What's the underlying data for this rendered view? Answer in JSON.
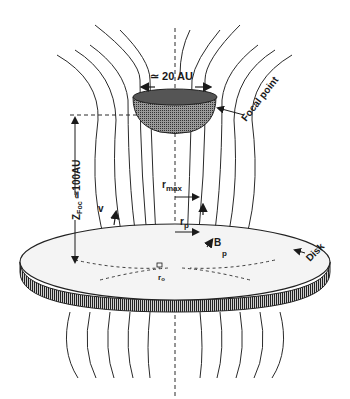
{
  "diagram": {
    "labels": {
      "focal_width": "≃ 20 AU",
      "focal_point": "Focal point",
      "z_foc_main": "Z",
      "z_foc_sub": "Foc",
      "z_foc_value": " ≃100AU",
      "r_max_main": "r",
      "r_max_sub": "max",
      "r_p_main": "r",
      "r_p_sub": "p",
      "b_p_main": "B",
      "b_p_sub": "p",
      "v_label": "v",
      "r_o_main": "r",
      "r_o_sub": "o",
      "disk": "Disk"
    },
    "colors": {
      "line": "#2a2a2a",
      "disk_top": "#f2f2f2",
      "disk_edge": "#555555",
      "focal_fill": "#888888"
    }
  }
}
